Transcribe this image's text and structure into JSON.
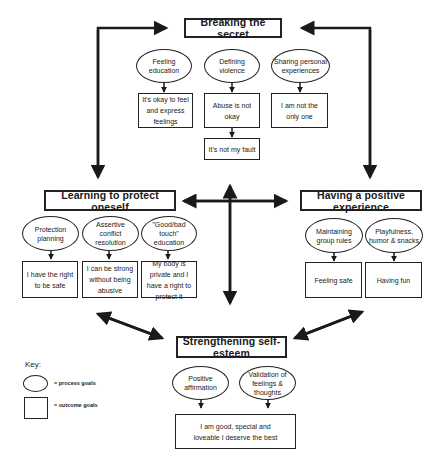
{
  "diagram": {
    "nodes": {
      "breaking": {
        "title": "Breaking the secret",
        "process_goals": [
          "Feeling education",
          "Defining violence",
          "Sharing personal experiences"
        ],
        "outcome_goals": [
          "It's okay to feel and express feelings",
          "Abuse is not okay",
          "I am not the only one",
          "It's not my fault"
        ]
      },
      "learning": {
        "title": "Learning to protect oneself",
        "process_goals": [
          "Protection planning",
          "Assertive conflict resolution",
          "\"Good/bad touch\" education"
        ],
        "outcome_goals": [
          "I have the right to be safe",
          "I can be strong without being abusive",
          "My body is private and I have a right to protect it"
        ]
      },
      "positive": {
        "title": "Having a positive experience",
        "process_goals": [
          "Maintaining group rules",
          "Playfulness, humor & snacks"
        ],
        "outcome_goals": [
          "Feeling safe",
          "Having fun"
        ]
      },
      "esteem": {
        "title": "Strengthening self-esteem",
        "process_goals": [
          "Positive affirmation",
          "Validation of feelings & thoughts"
        ],
        "outcome_goals": [
          "I am good, special and loveable I deserve the best"
        ]
      }
    },
    "key": {
      "title": "Key:",
      "items": [
        {
          "shape": "ellipse",
          "label": "= process goals"
        },
        {
          "shape": "rectangle",
          "label": "= outcome goals"
        }
      ]
    },
    "connections": [
      {
        "from": "Learning to protect oneself",
        "to": "Breaking the secret",
        "type": "bidirectional"
      },
      {
        "from": "Breaking the secret",
        "to": "Having a positive experience",
        "type": "bidirectional"
      },
      {
        "from": "Learning to protect oneself",
        "to": "Having a positive experience",
        "type": "bidirectional"
      },
      {
        "from": "Breaking the secret",
        "to": "Strengthening self-esteem",
        "type": "bidirectional"
      },
      {
        "from": "Learning to protect oneself",
        "to": "Strengthening self-esteem",
        "type": "bidirectional"
      },
      {
        "from": "Having a positive experience",
        "to": "Strengthening self-esteem",
        "type": "bidirectional"
      }
    ],
    "colors": {
      "stroke": "#1a1a1a",
      "background": "#ffffff"
    }
  }
}
